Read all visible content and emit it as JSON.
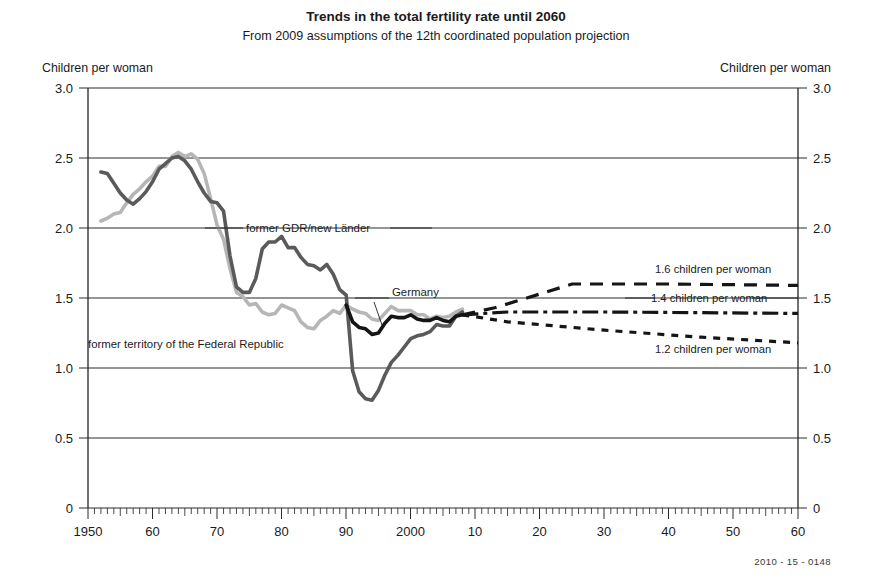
{
  "header": {
    "title": "Trends in the total fertility rate until 2060",
    "subtitle": "From 2009 assumptions of the 12th coordinated population projection"
  },
  "footer": {
    "code": "2010 - 15 - 0148"
  },
  "axis": {
    "left_label": "Children per woman",
    "right_label": "Children per woman"
  },
  "labels": {
    "gdr": "former GDR/new Länder",
    "west": "former territory of the Federal Republic",
    "germany": "Germany",
    "scenario_high": "1.6 children per woman",
    "scenario_mid": "1.4 children per woman",
    "scenario_low": "1.2 children per woman"
  },
  "chart_data": {
    "type": "line",
    "title": "Trends in the total fertility rate until 2060",
    "subtitle": "From 2009 assumptions of the 12th coordinated population projection",
    "xlabel": "",
    "ylabel": "Children per woman",
    "xlim": [
      1950,
      2060
    ],
    "ylim": [
      0,
      3.0
    ],
    "yticks": [
      "0",
      "0.5",
      "1.0",
      "1.5",
      "2.0",
      "2.5",
      "3.0"
    ],
    "ytick_values": [
      0,
      0.5,
      1.0,
      1.5,
      2.0,
      2.5,
      3.0
    ],
    "xticks": [
      "1950",
      "60",
      "70",
      "80",
      "90",
      "2000",
      "10",
      "20",
      "30",
      "40",
      "50",
      "60"
    ],
    "xtick_values": [
      1950,
      1960,
      1970,
      1980,
      1990,
      2000,
      2010,
      2020,
      2030,
      2040,
      2050,
      2060
    ],
    "grid": "horizontal",
    "legend_position": "inline-annotations",
    "colors": {
      "gdr": "#5a5a5a",
      "west": "#b6b6b6",
      "germany": "#151515",
      "projection": "#151515"
    },
    "series": [
      {
        "name": "former GDR/new Länder",
        "style": "solid",
        "color": "#5a5a5a",
        "x": [
          1952,
          1953,
          1954,
          1955,
          1956,
          1957,
          1958,
          1959,
          1960,
          1961,
          1962,
          1963,
          1964,
          1965,
          1966,
          1967,
          1968,
          1969,
          1970,
          1971,
          1972,
          1973,
          1974,
          1975,
          1976,
          1977,
          1978,
          1979,
          1980,
          1981,
          1982,
          1983,
          1984,
          1985,
          1986,
          1987,
          1988,
          1989,
          1990,
          1991,
          1992,
          1993,
          1994,
          1995,
          1996,
          1997,
          1998,
          1999,
          2000,
          2001,
          2002,
          2003,
          2004,
          2005,
          2006,
          2007,
          2008
        ],
        "values": [
          2.4,
          2.39,
          2.32,
          2.25,
          2.2,
          2.17,
          2.21,
          2.26,
          2.33,
          2.42,
          2.46,
          2.5,
          2.51,
          2.48,
          2.42,
          2.33,
          2.25,
          2.19,
          2.18,
          2.12,
          1.8,
          1.58,
          1.54,
          1.54,
          1.64,
          1.85,
          1.9,
          1.9,
          1.94,
          1.86,
          1.86,
          1.79,
          1.74,
          1.73,
          1.7,
          1.74,
          1.67,
          1.56,
          1.52,
          0.98,
          0.83,
          0.78,
          0.77,
          0.84,
          0.95,
          1.04,
          1.09,
          1.15,
          1.21,
          1.23,
          1.24,
          1.26,
          1.31,
          1.3,
          1.3,
          1.37,
          1.4
        ]
      },
      {
        "name": "former territory of the Federal Republic",
        "style": "solid",
        "color": "#b6b6b6",
        "x": [
          1952,
          1953,
          1954,
          1955,
          1956,
          1957,
          1958,
          1959,
          1960,
          1961,
          1962,
          1963,
          1964,
          1965,
          1966,
          1967,
          1968,
          1969,
          1970,
          1971,
          1972,
          1973,
          1974,
          1975,
          1976,
          1977,
          1978,
          1979,
          1980,
          1981,
          1982,
          1983,
          1984,
          1985,
          1986,
          1987,
          1988,
          1989,
          1990,
          1991,
          1992,
          1993,
          1994,
          1995,
          1996,
          1997,
          1998,
          1999,
          2000,
          2001,
          2002,
          2003,
          2004,
          2005,
          2006,
          2007,
          2008
        ],
        "values": [
          2.05,
          2.07,
          2.1,
          2.11,
          2.18,
          2.24,
          2.28,
          2.33,
          2.37,
          2.44,
          2.44,
          2.51,
          2.54,
          2.51,
          2.53,
          2.49,
          2.39,
          2.21,
          2.02,
          1.92,
          1.71,
          1.54,
          1.51,
          1.45,
          1.46,
          1.4,
          1.38,
          1.39,
          1.45,
          1.43,
          1.41,
          1.33,
          1.29,
          1.28,
          1.34,
          1.37,
          1.41,
          1.39,
          1.45,
          1.42,
          1.4,
          1.39,
          1.35,
          1.34,
          1.39,
          1.44,
          1.41,
          1.41,
          1.41,
          1.38,
          1.38,
          1.35,
          1.37,
          1.36,
          1.37,
          1.4,
          1.42
        ]
      },
      {
        "name": "Germany",
        "style": "solid",
        "color": "#151515",
        "x": [
          1990,
          1991,
          1992,
          1993,
          1994,
          1995,
          1996,
          1997,
          1998,
          1999,
          2000,
          2001,
          2002,
          2003,
          2004,
          2005,
          2006,
          2007,
          2008
        ],
        "values": [
          1.45,
          1.33,
          1.29,
          1.28,
          1.24,
          1.25,
          1.32,
          1.37,
          1.36,
          1.36,
          1.38,
          1.35,
          1.34,
          1.34,
          1.36,
          1.34,
          1.33,
          1.37,
          1.38
        ]
      },
      {
        "name": "1.6 children per woman",
        "style": "dashed",
        "color": "#151515",
        "projection": true,
        "x": [
          2008,
          2013,
          2018,
          2025,
          2040,
          2060
        ],
        "values": [
          1.38,
          1.43,
          1.5,
          1.6,
          1.6,
          1.59
        ]
      },
      {
        "name": "1.4 children per woman",
        "style": "dash-dot",
        "color": "#151515",
        "projection": true,
        "x": [
          2008,
          2015,
          2030,
          2060
        ],
        "values": [
          1.38,
          1.4,
          1.4,
          1.39
        ]
      },
      {
        "name": "1.2 children per woman",
        "style": "dotted",
        "color": "#151515",
        "projection": true,
        "x": [
          2008,
          2015,
          2030,
          2045,
          2060
        ],
        "values": [
          1.38,
          1.33,
          1.27,
          1.22,
          1.18
        ]
      }
    ],
    "annotations": [
      {
        "text": "former GDR/new Länder",
        "x": 1983,
        "y": 2.02
      },
      {
        "text": "former territory of the Federal Republic",
        "x": 1975,
        "y": 1.14
      },
      {
        "text": "Germany",
        "x": 1999,
        "y": 1.55
      },
      {
        "text": "1.6 children per woman",
        "x": 2040,
        "y": 1.69
      },
      {
        "text": "1.4 children per woman",
        "x": 2038,
        "y": 1.48
      },
      {
        "text": "1.2 children per woman",
        "x": 2041,
        "y": 1.12
      }
    ]
  }
}
